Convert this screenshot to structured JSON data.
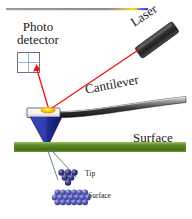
{
  "figure": {
    "background_color": "#ffffff",
    "width": 192,
    "height": 219
  },
  "labels": {
    "photodetector_line1": "Photo",
    "photodetector_line2": "detector",
    "laser": "Laser",
    "cantilever": "Cantilever",
    "surface_main": "Surface",
    "tip_small": "Tip",
    "surface_small": "Surface"
  },
  "colors": {
    "laser_beam": "#ee1111",
    "laser_body_dark": "#2b2b2b",
    "laser_body_light": "#6e6e6e",
    "cantilever_dark": "#1c1c1c",
    "cantilever_light": "#b9b9bd",
    "tip_cone": "#23309c",
    "tip_cone_dark": "#141d6b",
    "surface_band": "#4e7a22",
    "surface_band_light": "#86a84a",
    "laser_spot": "#f5b500",
    "detector_outline": "#6f6f7a",
    "detector_cross": "#7fb2e5",
    "atom_fill": "#4a4fa8",
    "atom_highlight": "#9aa0dd",
    "top_rule": "#8c8c8c",
    "top_rule_gradient_a": "#ffe000",
    "top_rule_gradient_b": "#3b3bd0",
    "guide_line": "#5a6a7a",
    "text": "#1a1a1a"
  },
  "elements": {
    "top_rule": {
      "x1": 6,
      "y1": 9,
      "x2": 148,
      "y2": 9
    },
    "detector_box": {
      "x": 17,
      "y": 52,
      "width": 23,
      "height": 21
    },
    "laser_body": {
      "cx": 157,
      "cy": 39,
      "length": 44,
      "thickness": 13,
      "angle_deg": -36
    },
    "beam_incident": {
      "x1": 138,
      "y1": 50,
      "x2": 49,
      "y2": 110
    },
    "beam_reflected": {
      "x1": 49,
      "y1": 110,
      "x2": 36,
      "y2": 69
    },
    "laser_spot": {
      "cx": 48,
      "cy": 110,
      "rx": 7,
      "ry": 3
    },
    "surface_band": {
      "x": 14,
      "y": 142,
      "width": 172,
      "height": 10
    },
    "tip_cluster_atoms": 6,
    "surface_lattice_rows": 3,
    "surface_lattice_cols": 9
  }
}
